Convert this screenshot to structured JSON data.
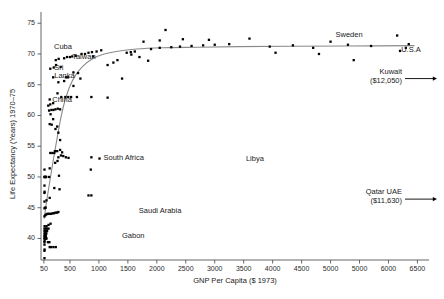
{
  "chart_data": {
    "type": "scatter",
    "title": "",
    "xlabel": "GNP Per Capita ($ 1973)",
    "ylabel": "Life Expectancy (Years) 1970–75",
    "xlim": [
      0,
      6700
    ],
    "ylim": [
      36.5,
      76.5
    ],
    "grid": false,
    "legend": "none",
    "xticks": [
      {
        "value": 50,
        "label": "50"
      },
      {
        "value": 500,
        "label": "500"
      },
      {
        "value": 1000,
        "label": "1000"
      },
      {
        "value": 1500,
        "label": "1500"
      },
      {
        "value": 2000,
        "label": "2000"
      },
      {
        "value": 2500,
        "label": "2500"
      },
      {
        "value": 3000,
        "label": "3000"
      },
      {
        "value": 3500,
        "label": "3500"
      },
      {
        "value": 4000,
        "label": "4000"
      },
      {
        "value": 4500,
        "label": "4500"
      },
      {
        "value": 5000,
        "label": "5000"
      },
      {
        "value": 5500,
        "label": "5000"
      },
      {
        "value": 6000,
        "label": "6000"
      },
      {
        "value": 6500,
        "label": "6500"
      }
    ],
    "yticks": [
      {
        "value": 40,
        "label": "40"
      },
      {
        "value": 45,
        "label": "45"
      },
      {
        "value": 50,
        "label": "50"
      },
      {
        "value": 55,
        "label": "55"
      },
      {
        "value": 60,
        "label": "60"
      },
      {
        "value": 65,
        "label": "65"
      },
      {
        "value": 70,
        "label": "70"
      },
      {
        "value": 75,
        "label": "75"
      }
    ],
    "points": [
      [
        60,
        38.0
      ],
      [
        62,
        38.2
      ],
      [
        60,
        39.0
      ],
      [
        60,
        39.4
      ],
      [
        62,
        39.6
      ],
      [
        60,
        40.0
      ],
      [
        64,
        40.0
      ],
      [
        70,
        40.0
      ],
      [
        78,
        40.0
      ],
      [
        86,
        40.0
      ],
      [
        95,
        40.0
      ],
      [
        60,
        40.4
      ],
      [
        66,
        40.4
      ],
      [
        74,
        40.4
      ],
      [
        84,
        40.4
      ],
      [
        60,
        40.8
      ],
      [
        70,
        40.8
      ],
      [
        80,
        40.8
      ],
      [
        92,
        40.8
      ],
      [
        60,
        41.2
      ],
      [
        72,
        41.2
      ],
      [
        88,
        41.2
      ],
      [
        105,
        41.2
      ],
      [
        60,
        41.6
      ],
      [
        78,
        41.6
      ],
      [
        100,
        41.6
      ],
      [
        130,
        41.6
      ],
      [
        150,
        38.6
      ],
      [
        175,
        38.6
      ],
      [
        215,
        38.6
      ],
      [
        255,
        38.6
      ],
      [
        120,
        39.4
      ],
      [
        145,
        39.4
      ],
      [
        60,
        36.8
      ],
      [
        62,
        42.0
      ],
      [
        96,
        42.0
      ],
      [
        130,
        42.2
      ],
      [
        165,
        42.4
      ],
      [
        60,
        43.6
      ],
      [
        75,
        43.8
      ],
      [
        90,
        43.9
      ],
      [
        110,
        44.0
      ],
      [
        130,
        44.0
      ],
      [
        150,
        44.0
      ],
      [
        175,
        44.0
      ],
      [
        200,
        44.1
      ],
      [
        225,
        44.1
      ],
      [
        250,
        44.2
      ],
      [
        275,
        44.2
      ],
      [
        300,
        44.3
      ],
      [
        60,
        44.9
      ],
      [
        70,
        45.0
      ],
      [
        80,
        45.0
      ],
      [
        60,
        46.0
      ],
      [
        95,
        46.2
      ],
      [
        150,
        46.6
      ],
      [
        60,
        47.4
      ],
      [
        62,
        47.6
      ],
      [
        820,
        47.0
      ],
      [
        870,
        47.0
      ],
      [
        60,
        48.6
      ],
      [
        230,
        48.2
      ],
      [
        320,
        48.0
      ],
      [
        60,
        50.0
      ],
      [
        64,
        50.0
      ],
      [
        68,
        50.0
      ],
      [
        74,
        50.0
      ],
      [
        82,
        50.0
      ],
      [
        90,
        50.0
      ],
      [
        140,
        50.0
      ],
      [
        310,
        50.2
      ],
      [
        860,
        51.2
      ],
      [
        60,
        51.2
      ],
      [
        150,
        51.4
      ],
      [
        245,
        52.3
      ],
      [
        285,
        52.6
      ],
      [
        300,
        53.2
      ],
      [
        345,
        53.5
      ],
      [
        385,
        53.4
      ],
      [
        430,
        53.2
      ],
      [
        475,
        53.1
      ],
      [
        870,
        53.2
      ],
      [
        1010,
        53.0
      ],
      [
        240,
        54.2
      ],
      [
        280,
        54.2
      ],
      [
        330,
        54.4
      ],
      [
        365,
        54.0
      ],
      [
        160,
        53.9
      ],
      [
        195,
        53.9
      ],
      [
        230,
        53.9
      ],
      [
        330,
        56.0
      ],
      [
        300,
        57.2
      ],
      [
        250,
        57.8
      ],
      [
        280,
        58.2
      ],
      [
        150,
        58.6
      ],
      [
        185,
        58.5
      ],
      [
        210,
        59.4
      ],
      [
        165,
        60.2
      ],
      [
        140,
        60.8
      ],
      [
        180,
        60.9
      ],
      [
        215,
        60.9
      ],
      [
        250,
        61.0
      ],
      [
        290,
        61.1
      ],
      [
        330,
        61.0
      ],
      [
        125,
        61.6
      ],
      [
        160,
        61.8
      ],
      [
        210,
        62.0
      ],
      [
        350,
        63.0
      ],
      [
        420,
        63.0
      ],
      [
        470,
        63.0
      ],
      [
        520,
        63.0
      ],
      [
        620,
        63.0
      ],
      [
        870,
        63.0
      ],
      [
        285,
        63.6
      ],
      [
        150,
        62.6
      ],
      [
        300,
        65.4
      ],
      [
        400,
        65.6
      ],
      [
        430,
        66.2
      ],
      [
        465,
        66.2
      ],
      [
        210,
        66.2
      ],
      [
        1400,
        66.0
      ],
      [
        160,
        67.6
      ],
      [
        220,
        67.8
      ],
      [
        340,
        67.9
      ],
      [
        260,
        68.2
      ],
      [
        1150,
        68.2
      ],
      [
        1250,
        68.6
      ],
      [
        1320,
        69.0
      ],
      [
        255,
        69.0
      ],
      [
        305,
        69.2
      ],
      [
        400,
        69.3
      ],
      [
        450,
        69.5
      ],
      [
        500,
        69.5
      ],
      [
        540,
        69.6
      ],
      [
        600,
        69.7
      ],
      [
        700,
        70.0
      ],
      [
        760,
        70.0
      ],
      [
        820,
        70.2
      ],
      [
        880,
        70.3
      ],
      [
        960,
        70.4
      ],
      [
        1040,
        70.6
      ],
      [
        1480,
        70.2
      ],
      [
        1560,
        69.9
      ],
      [
        1700,
        69.5
      ],
      [
        1850,
        68.9
      ],
      [
        1900,
        70.8
      ],
      [
        2050,
        71.0
      ],
      [
        2250,
        71.1
      ],
      [
        2400,
        71.2
      ],
      [
        2600,
        71.3
      ],
      [
        2800,
        71.4
      ],
      [
        3000,
        71.5
      ],
      [
        3250,
        71.6
      ],
      [
        1770,
        72.0
      ],
      [
        2050,
        72.2
      ],
      [
        2450,
        72.4
      ],
      [
        2900,
        72.3
      ],
      [
        2150,
        73.9
      ],
      [
        3600,
        72.5
      ],
      [
        3950,
        71.2
      ],
      [
        4050,
        70.2
      ],
      [
        4350,
        71.4
      ],
      [
        4700,
        71.0
      ],
      [
        4800,
        70.0
      ],
      [
        5000,
        72.0
      ],
      [
        5300,
        71.5
      ],
      [
        5400,
        69.0
      ],
      [
        5700,
        71.3
      ],
      [
        6150,
        73.0
      ],
      [
        6350,
        71.6
      ],
      [
        6300,
        71.0
      ],
      [
        6200,
        70.5
      ],
      [
        1150,
        62.9
      ],
      [
        1550,
        70.3
      ],
      [
        1620,
        70.4
      ],
      [
        900,
        69.6
      ],
      [
        640,
        66.9
      ],
      [
        680,
        66.0
      ],
      [
        560,
        64.8
      ],
      [
        560,
        67.0
      ]
    ],
    "fit_curve": {
      "style": "smooth-line",
      "color": "#8a8a8a",
      "points": [
        [
          55,
          43.2
        ],
        [
          90,
          45.6
        ],
        [
          130,
          48.0
        ],
        [
          175,
          50.6
        ],
        [
          220,
          53.2
        ],
        [
          265,
          55.6
        ],
        [
          310,
          58.0
        ],
        [
          360,
          60.4
        ],
        [
          420,
          62.6
        ],
        [
          500,
          64.8
        ],
        [
          600,
          66.6
        ],
        [
          720,
          68.0
        ],
        [
          870,
          69.1
        ],
        [
          1060,
          69.9
        ],
        [
          1300,
          70.4
        ],
        [
          1650,
          70.8
        ],
        [
          2100,
          71.0
        ],
        [
          2700,
          71.1
        ],
        [
          3400,
          71.2
        ],
        [
          4300,
          71.25
        ],
        [
          5300,
          71.3
        ],
        [
          6450,
          71.35
        ]
      ]
    },
    "point_labels": [
      {
        "text": "Cuba",
        "x": 380,
        "y": 70.0,
        "anchor": "above"
      },
      {
        "text": "Taiwan",
        "x": 470,
        "y": 69.4,
        "anchor": "right"
      },
      {
        "text": "Sri",
        "x": 160,
        "y": 67.6,
        "anchor": "right"
      },
      {
        "text": "Lanka",
        "x": 160,
        "y": 66.4,
        "anchor": "right"
      },
      {
        "text": "China",
        "x": 125,
        "y": 62.4,
        "anchor": "right"
      },
      {
        "text": "South Africa",
        "x": 1010,
        "y": 53.0,
        "anchor": "right"
      },
      {
        "text": "Saudi Arabia",
        "x": 1620,
        "y": 44.4,
        "anchor": "right"
      },
      {
        "text": "Gabon",
        "x": 1330,
        "y": 40.4,
        "anchor": "right"
      },
      {
        "text": "Libya",
        "x": 3470,
        "y": 52.9,
        "anchor": "right"
      },
      {
        "text": "Sweden",
        "x": 5320,
        "y": 72.0,
        "anchor": "above"
      },
      {
        "text": "U.S.A",
        "x": 6150,
        "y": 70.5,
        "anchor": "right"
      }
    ],
    "offscale_annotations": [
      {
        "name": "Kuwait",
        "value_label": "($12,050)",
        "y": 66.0,
        "arrow": "right"
      },
      {
        "name": "Qatar UAE",
        "value_label": "($11,630)",
        "y": 46.4,
        "arrow": "right"
      }
    ]
  }
}
